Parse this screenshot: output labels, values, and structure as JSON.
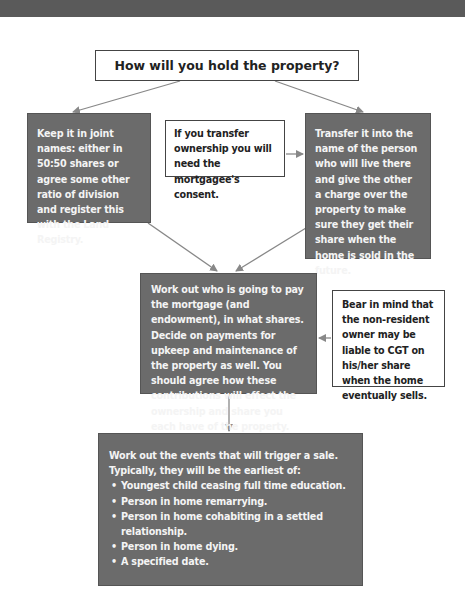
{
  "colors": {
    "top_bar": "#5a5a5a",
    "dark_box": "#6b6b6b",
    "dark_box_text": "#f4f4f4",
    "light_box_border": "#444444",
    "arrow": "#888888"
  },
  "diagram": {
    "title": "How will you hold the property?",
    "left_option": "Keep it in joint names: either in 50:50 shares or agree some other ratio of division and register this with the Land Registry.",
    "transfer_note": "If you transfer ownership you will need the mortgagee's consent.",
    "right_option": "Transfer it into the name of the person who will live there and give the other a charge over the property to make sure they get their share when the home is sold in the future.",
    "payments_step": "Work out who is going to pay the mortgage (and endowment), in what shares. Decide on payments for upkeep and maintenance of the property as well. You should agree how these contributions will effect the ownership and share you each have of the property.",
    "cgt_note": "Bear in mind that the non-resident owner may be liable to CGT on his/her share when the home eventually sells.",
    "trigger_step": {
      "intro": "Work out the events that will trigger a sale. Typically, they will be the earliest of:",
      "items": [
        "Youngest child ceasing full time education.",
        "Person in home remarrying.",
        "Person in home cohabiting in a settled relationship.",
        "Person in home dying.",
        "A specified date."
      ]
    }
  }
}
